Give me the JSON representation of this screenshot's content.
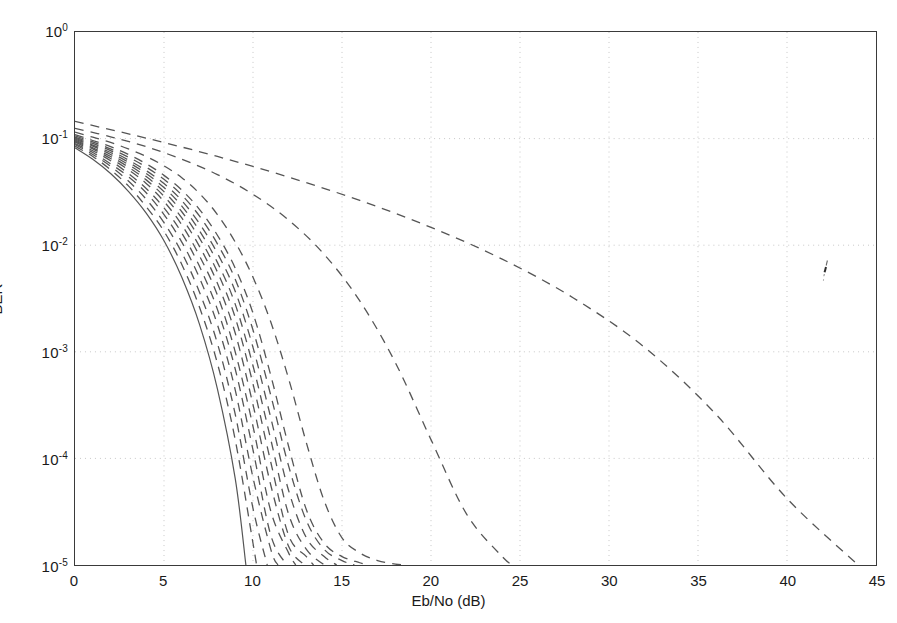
{
  "figure": {
    "kind": "semilog-y-plot",
    "background": "#ffffff",
    "frame_color": "#3a3a3a",
    "grid_color": "#c8c8c8",
    "curve_color": "#555555"
  },
  "axes": {
    "x_title": "Eb/No (dB)",
    "y_title": "BER",
    "x_ticks": [
      "0",
      "5",
      "10",
      "15",
      "20",
      "25",
      "30",
      "35",
      "40",
      "45"
    ],
    "x_tick_values": [
      0,
      5,
      10,
      15,
      20,
      25,
      30,
      35,
      40,
      45
    ],
    "y_ticks": [
      {
        "mantissa": "10",
        "exponent": "0"
      },
      {
        "mantissa": "10",
        "exponent": "-1"
      },
      {
        "mantissa": "10",
        "exponent": "-2"
      },
      {
        "mantissa": "10",
        "exponent": "-3"
      },
      {
        "mantissa": "10",
        "exponent": "-4"
      },
      {
        "mantissa": "10",
        "exponent": "-5"
      }
    ],
    "y_tick_values": [
      1,
      0.1,
      0.01,
      0.001,
      0.0001,
      1e-05
    ]
  },
  "chart_data": {
    "type": "line",
    "title": "",
    "subtitle": "",
    "xlabel": "Eb/No (dB)",
    "ylabel": "BER",
    "xlim": [
      0,
      45
    ],
    "ylim": [
      1e-05,
      1
    ],
    "yscale": "log",
    "xscale": "linear",
    "grid": true,
    "grid_style": "dotted",
    "legend": "none",
    "annotations": [
      {
        "name": "scan-artifact",
        "x": 42.2,
        "y": 0.0072,
        "note": "small stray ink mark"
      }
    ],
    "series": [
      {
        "name": "curve-01-solid",
        "style": "solid",
        "x": [
          0,
          1,
          2,
          3,
          4,
          5,
          6,
          7,
          8,
          9,
          9.6
        ],
        "y": [
          0.082,
          0.064,
          0.047,
          0.032,
          0.02,
          0.011,
          0.005,
          0.0018,
          0.00045,
          6.5e-05,
          1e-05
        ]
      },
      {
        "name": "curve-02",
        "style": "dashed",
        "x": [
          0,
          1,
          2,
          3,
          4,
          5,
          6,
          7,
          8,
          9,
          10,
          10.2
        ],
        "y": [
          0.085,
          0.068,
          0.051,
          0.036,
          0.023,
          0.0135,
          0.0066,
          0.0026,
          0.00078,
          0.00015,
          1.6e-05,
          1e-05
        ]
      },
      {
        "name": "curve-03",
        "style": "dashed",
        "x": [
          0,
          1,
          2,
          3,
          4,
          5,
          6,
          7,
          8,
          9,
          10,
          10.8
        ],
        "y": [
          0.088,
          0.071,
          0.055,
          0.04,
          0.027,
          0.0163,
          0.0085,
          0.0036,
          0.0012,
          0.00026,
          3.4e-05,
          1e-05
        ]
      },
      {
        "name": "curve-04",
        "style": "dashed",
        "x": [
          0,
          1,
          2,
          3,
          4,
          5,
          6,
          7,
          8,
          9,
          10,
          11,
          11.4
        ],
        "y": [
          0.09,
          0.074,
          0.058,
          0.044,
          0.031,
          0.0194,
          0.0107,
          0.0049,
          0.0018,
          0.00044,
          6.6e-05,
          1.4e-05,
          1e-05
        ]
      },
      {
        "name": "curve-05",
        "style": "dashed",
        "x": [
          0,
          1,
          2,
          3,
          4,
          5,
          6,
          7,
          8,
          9,
          10,
          11,
          11.9
        ],
        "y": [
          0.093,
          0.077,
          0.062,
          0.047,
          0.034,
          0.0224,
          0.013,
          0.0063,
          0.0025,
          0.00069,
          0.00012,
          1.9e-05,
          1e-05
        ]
      },
      {
        "name": "curve-06",
        "style": "dashed",
        "x": [
          0,
          1,
          2,
          3,
          4,
          5,
          6,
          7,
          8,
          9,
          10,
          11,
          12,
          12.4
        ],
        "y": [
          0.095,
          0.08,
          0.065,
          0.051,
          0.038,
          0.0257,
          0.0155,
          0.0079,
          0.0034,
          0.001,
          0.0002,
          3.2e-05,
          1.3e-05,
          1e-05
        ]
      },
      {
        "name": "curve-07",
        "style": "dashed",
        "x": [
          0,
          1,
          2,
          3,
          4,
          5,
          6,
          7,
          8,
          9,
          10,
          11,
          12,
          12.9
        ],
        "y": [
          0.097,
          0.082,
          0.068,
          0.054,
          0.041,
          0.0288,
          0.018,
          0.0097,
          0.0044,
          0.0015,
          0.00032,
          5.6e-05,
          1.5e-05,
          1e-05
        ]
      },
      {
        "name": "curve-08",
        "style": "dashed",
        "x": [
          0,
          1,
          2,
          3,
          4,
          5,
          6,
          7,
          8,
          9,
          10,
          11,
          12,
          13,
          13.4
        ],
        "y": [
          0.099,
          0.085,
          0.071,
          0.057,
          0.044,
          0.0318,
          0.0206,
          0.0116,
          0.0056,
          0.0021,
          0.0005,
          9.2e-05,
          1.9e-05,
          1.2e-05,
          1e-05
        ]
      },
      {
        "name": "curve-09",
        "style": "dashed",
        "x": [
          0,
          1,
          2,
          3,
          4,
          5,
          6,
          7,
          8,
          9,
          10,
          11,
          12,
          13,
          14.0
        ],
        "y": [
          0.101,
          0.087,
          0.074,
          0.06,
          0.047,
          0.0347,
          0.0233,
          0.0136,
          0.0069,
          0.0028,
          0.00074,
          0.00015,
          3e-05,
          1.4e-05,
          1e-05
        ]
      },
      {
        "name": "curve-10",
        "style": "dashed",
        "x": [
          0,
          1,
          2,
          3,
          4,
          5,
          6,
          7,
          8,
          9,
          10,
          11,
          12,
          13,
          14,
          14.7
        ],
        "y": [
          0.103,
          0.09,
          0.077,
          0.063,
          0.05,
          0.0379,
          0.0262,
          0.0159,
          0.0084,
          0.0037,
          0.0011,
          0.00024,
          5e-05,
          1.8e-05,
          1.2e-05,
          1e-05
        ]
      },
      {
        "name": "curve-11",
        "style": "dashed",
        "x": [
          0,
          1,
          2,
          3,
          4,
          5,
          6,
          7,
          8,
          9,
          10,
          11,
          12,
          13,
          14,
          15,
          15.7
        ],
        "y": [
          0.106,
          0.093,
          0.08,
          0.067,
          0.054,
          0.0415,
          0.0295,
          0.0187,
          0.0103,
          0.0048,
          0.0016,
          0.00039,
          8.5e-05,
          2.6e-05,
          1.4e-05,
          1.1e-05,
          1e-05
        ]
      },
      {
        "name": "curve-12",
        "style": "dashed",
        "x": [
          0,
          1,
          2,
          3,
          4,
          5,
          6,
          7,
          8,
          9,
          10,
          11,
          12,
          13,
          14,
          15,
          16,
          16.4
        ],
        "y": [
          0.109,
          0.096,
          0.084,
          0.071,
          0.058,
          0.0452,
          0.0329,
          0.0216,
          0.0124,
          0.0061,
          0.0023,
          0.0006,
          0.00013,
          3.3e-05,
          1.6e-05,
          1.2e-05,
          1.05e-05,
          1e-05
        ]
      },
      {
        "name": "curve-13",
        "style": "dashed",
        "x": [
          0,
          1,
          2,
          3,
          4,
          5,
          6,
          7,
          8,
          9,
          10,
          11,
          12,
          13,
          14,
          15,
          16,
          17,
          18,
          18.7
        ],
        "y": [
          0.115,
          0.103,
          0.092,
          0.08,
          0.068,
          0.0555,
          0.043,
          0.0305,
          0.0194,
          0.0107,
          0.005,
          0.0019,
          0.00056,
          0.00014,
          4e-05,
          1.8e-05,
          1.3e-05,
          1.1e-05,
          1.02e-05,
          1e-05
        ]
      },
      {
        "name": "curve-14",
        "style": "dashed",
        "x": [
          0,
          2,
          4,
          6,
          8,
          10,
          12,
          14,
          16,
          18,
          20,
          22,
          24,
          24.6
        ],
        "y": [
          0.125,
          0.104,
          0.084,
          0.064,
          0.046,
          0.03,
          0.0172,
          0.0082,
          0.003,
          0.00079,
          0.00015,
          3e-05,
          1.2e-05,
          1e-05
        ]
      },
      {
        "name": "curve-15",
        "style": "dashed",
        "x": [
          0,
          4,
          8,
          12,
          16,
          20,
          24,
          28,
          32,
          36,
          40,
          44
        ],
        "y": [
          0.145,
          0.101,
          0.068,
          0.0435,
          0.0263,
          0.0147,
          0.0074,
          0.0032,
          0.0011,
          0.00026,
          4.2e-05,
          1e-05
        ]
      }
    ]
  }
}
